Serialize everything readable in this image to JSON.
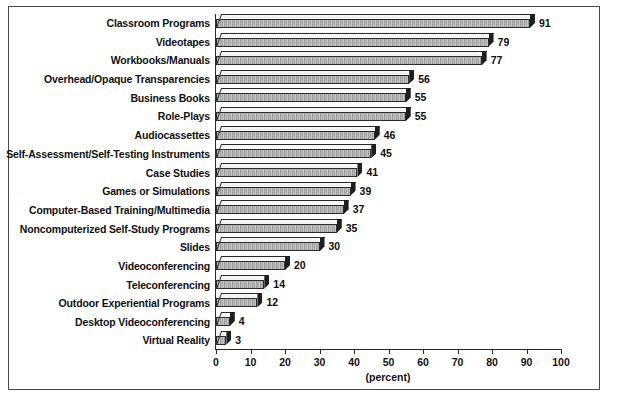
{
  "chart_data": {
    "type": "bar",
    "orientation": "horizontal",
    "title": "",
    "subtitle": "",
    "xlabel": "(percent)",
    "ylabel": "",
    "xlim": [
      0,
      100
    ],
    "xticks": [
      0,
      10,
      20,
      30,
      40,
      50,
      60,
      70,
      80,
      90,
      100
    ],
    "grid": false,
    "legend": null,
    "categories": [
      "Classroom Programs",
      "Videotapes",
      "Workbooks/Manuals",
      "Overhead/Opaque Transparencies",
      "Business Books",
      "Role-Plays",
      "Audiocassettes",
      "Self-Assessment/Self-Testing Instruments",
      "Case Studies",
      "Games or Simulations",
      "Computer-Based Training/Multimedia",
      "Noncomputerized Self-Study Programs",
      "Slides",
      "Videoconferencing",
      "Teleconferencing",
      "Outdoor Experiential Programs",
      "Desktop Videoconferencing",
      "Virtual Reality"
    ],
    "values": [
      91,
      79,
      77,
      56,
      55,
      55,
      46,
      45,
      41,
      39,
      37,
      35,
      30,
      20,
      14,
      12,
      4,
      3
    ],
    "value_labels": [
      "91",
      "79",
      "77",
      "56",
      "55",
      "55",
      "46",
      "45",
      "41",
      "39",
      "37",
      "35",
      "30",
      "20",
      "14",
      "12",
      "4",
      "3"
    ]
  },
  "style": {
    "bar_front_color": "#b0b0b0",
    "bar_top_color": "#f4f4f4",
    "bar_cap_color": "#1e1e1e",
    "outline_color": "#2b2b2b",
    "background_color": "#ffffff",
    "text_color": "#111111",
    "frame_color": "#4a4a4a"
  }
}
